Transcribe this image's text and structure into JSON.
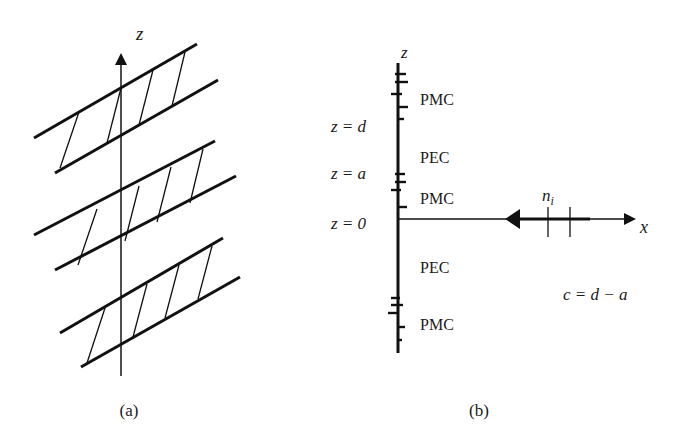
{
  "panel_a": {
    "caption": "(a)",
    "axis_label": "z",
    "strips": 3,
    "description": "Periodic array of slanted strips with hatching crossing the z-axis"
  },
  "panel_b": {
    "caption": "(b)",
    "z_axis_label": "z",
    "x_axis_label": "x",
    "left_labels": [
      "z = d",
      "z = a",
      "z = 0"
    ],
    "region_labels": [
      "PMC",
      "PEC",
      "PMC",
      "PEC",
      "PMC"
    ],
    "incidence_label": "n",
    "incidence_subscript": "i",
    "relation": "c = d − a"
  }
}
